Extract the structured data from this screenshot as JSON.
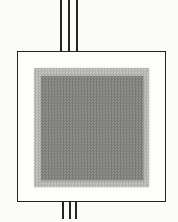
{
  "figure": {
    "background_color": "#fbfbf9",
    "package_outline": {
      "fill_color": "#fdfdfc",
      "border_color": "#222220"
    },
    "outer_pad": {
      "fill_color": "#c5c5c3"
    },
    "inner_pad": {
      "fill_color": "#90908e"
    },
    "leads": {
      "color": "#242422",
      "top_count": 3,
      "bottom_count": 3
    }
  }
}
